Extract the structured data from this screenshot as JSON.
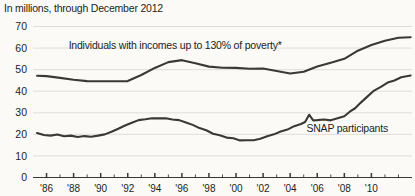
{
  "caption": "In millions, through December 2012",
  "chart_data": {
    "type": "line",
    "title": "",
    "subtitle": "In millions, through December 2012",
    "xlabel": "",
    "ylabel": "",
    "units": "millions of people",
    "grid": true,
    "legend_position": "inline-annotation",
    "xlim": [
      1985,
      2013
    ],
    "ylim": [
      0,
      70
    ],
    "y_ticks": [
      0,
      10,
      20,
      30,
      40,
      50,
      60,
      70
    ],
    "y_tick_labels": [
      "0",
      "10",
      "20",
      "30",
      "40",
      "50",
      "60",
      "70"
    ],
    "x_ticks": [
      1986,
      1987,
      1988,
      1989,
      1990,
      1991,
      1992,
      1993,
      1994,
      1995,
      1996,
      1997,
      1998,
      1999,
      2000,
      2001,
      2002,
      2003,
      2004,
      2005,
      2006,
      2007,
      2008,
      2009,
      2010,
      2011,
      2012
    ],
    "x_tick_labels_shown": [
      "'86",
      "'88",
      "'90",
      "'92",
      "'94",
      "'96",
      "'98",
      "'00",
      "'02",
      "'04",
      "'06",
      "'08",
      "'10"
    ],
    "x_labeled_years": [
      1986,
      1988,
      1990,
      1992,
      1994,
      1996,
      1998,
      2000,
      2002,
      2004,
      2006,
      2008,
      2010
    ],
    "series": [
      {
        "name": "Individuals with incomes up to 130% of poverty*",
        "annotation": "Individuals with incomes up to 130% of poverty*",
        "color": "#3b3835",
        "x": [
          1985.3,
          1986,
          1987,
          1988,
          1989,
          1990,
          1991,
          1992,
          1993,
          1994,
          1995,
          1996,
          1997,
          1998,
          1999,
          2000,
          2001,
          2002,
          2003,
          2004,
          2005,
          2006,
          2007,
          2008,
          2009,
          2010,
          2011,
          2012,
          2012.9
        ],
        "values": [
          47.2,
          47.0,
          46.2,
          45.3,
          44.7,
          44.6,
          44.6,
          44.7,
          47.5,
          50.8,
          53.5,
          54.4,
          53.0,
          51.4,
          50.9,
          50.8,
          50.4,
          50.5,
          49.4,
          48.2,
          49.0,
          51.5,
          53.2,
          55.0,
          58.8,
          61.4,
          63.4,
          64.8,
          65.0
        ]
      },
      {
        "name": "SNAP participants",
        "annotation": "SNAP participants",
        "color": "#3b3835",
        "x": [
          1985.3,
          1985.8,
          1986.3,
          1986.8,
          1987.3,
          1987.8,
          1988.3,
          1988.8,
          1989.3,
          1989.8,
          1990.3,
          1990.8,
          1991.3,
          1991.8,
          1992.3,
          1992.8,
          1993.3,
          1993.8,
          1994.3,
          1994.8,
          1995.3,
          1995.8,
          1996.3,
          1996.8,
          1997.3,
          1997.8,
          1998.3,
          1998.8,
          1999.3,
          1999.8,
          2000.3,
          2000.8,
          2001.3,
          2001.8,
          2002.3,
          2002.8,
          2003.3,
          2003.8,
          2004.3,
          2004.8,
          2005.1,
          2005.4,
          2005.7,
          2006.0,
          2006.5,
          2007.0,
          2007.5,
          2008.0,
          2008.4,
          2008.8,
          2009.2,
          2009.7,
          2010.2,
          2010.7,
          2011.2,
          2011.7,
          2012.2,
          2012.9
        ],
        "values": [
          20.6,
          19.7,
          19.4,
          19.9,
          19.1,
          19.4,
          18.8,
          19.2,
          18.9,
          19.4,
          20.0,
          21.2,
          22.6,
          24.1,
          25.4,
          26.6,
          27.0,
          27.5,
          27.4,
          27.5,
          26.9,
          26.6,
          25.5,
          24.4,
          22.9,
          21.9,
          20.3,
          19.6,
          18.5,
          18.2,
          17.2,
          17.3,
          17.3,
          18.0,
          19.1,
          20.0,
          21.3,
          22.2,
          23.8,
          24.8,
          25.7,
          29.1,
          26.5,
          26.6,
          26.9,
          26.5,
          27.5,
          28.4,
          30.5,
          32.1,
          34.6,
          37.5,
          40.3,
          42.0,
          44.0,
          45.0,
          46.5,
          47.3
        ]
      }
    ],
    "annotations": [
      {
        "text": "Individuals with incomes up to 130% of poverty*",
        "x": 1995.5,
        "y": 59.5
      },
      {
        "text": "SNAP participants",
        "x": 2005.2,
        "y": 21.0
      }
    ]
  }
}
